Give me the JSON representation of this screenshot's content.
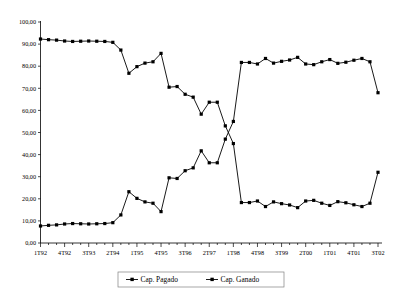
{
  "chart_data": {
    "type": "line",
    "title": "",
    "subtitle": "",
    "xlabel": "",
    "ylabel": "",
    "ylim": [
      0,
      100
    ],
    "ytick_labels": [
      "0,00",
      "10,00",
      "20,00",
      "30,00",
      "40,00",
      "50,00",
      "60,00",
      "70,00",
      "80,00",
      "90,00",
      "100,00"
    ],
    "ytick_values": [
      0,
      10,
      20,
      30,
      40,
      50,
      60,
      70,
      80,
      90,
      100
    ],
    "grid": false,
    "legend_position": "bottom",
    "categories": [
      "1T92",
      "2T92",
      "3T92",
      "4T92",
      "1T93",
      "2T93",
      "3T93",
      "4T93",
      "1T94",
      "2T94",
      "3T94",
      "4T94",
      "1T95",
      "2T95",
      "3T95",
      "4T95",
      "1T96",
      "2T96",
      "3T96",
      "4T96",
      "1T97",
      "2T97",
      "3T97",
      "4T97",
      "1T98",
      "2T98",
      "3T98",
      "4T98",
      "1T99",
      "2T99",
      "3T99",
      "4T99",
      "1T00",
      "2T00",
      "3T00",
      "4T00",
      "1T01",
      "2T01",
      "3T01",
      "4T01",
      "1T02",
      "2T02",
      "3T02"
    ],
    "xtick_labels": [
      "1T92",
      "4T92",
      "3T93",
      "2T94",
      "1T95",
      "4T95",
      "3T96",
      "2T97",
      "1T98",
      "4T98",
      "3T99",
      "2T00",
      "1T01",
      "4T01",
      "3T02"
    ],
    "xtick_indices": [
      0,
      3,
      6,
      9,
      12,
      15,
      18,
      21,
      24,
      27,
      30,
      33,
      36,
      39,
      42
    ],
    "series": [
      {
        "name": "Cap. Pagado",
        "marker": "square",
        "color": "#000000",
        "values": [
          92.3,
          92.0,
          91.8,
          91.4,
          91.2,
          91.3,
          91.4,
          91.3,
          91.2,
          90.8,
          87.3,
          76.8,
          79.8,
          81.4,
          82.0,
          85.8,
          70.5,
          70.8,
          67.3,
          66.0,
          58.3,
          63.7,
          63.7,
          53.0,
          45.0,
          18.3,
          18.3,
          19.0,
          16.5,
          18.6,
          17.8,
          17.2,
          16.0,
          19.0,
          19.3,
          18.0,
          17.0,
          18.7,
          18.2,
          17.3,
          16.5,
          18.0,
          32.0
        ]
      },
      {
        "name": "Cap. Ganado",
        "marker": "square",
        "color": "#000000",
        "values": [
          7.7,
          8.0,
          8.2,
          8.6,
          8.8,
          8.7,
          8.6,
          8.7,
          8.8,
          9.2,
          12.7,
          23.2,
          20.2,
          18.6,
          18.0,
          14.2,
          29.5,
          29.2,
          32.7,
          34.0,
          41.7,
          36.3,
          36.3,
          47.0,
          55.0,
          81.7,
          81.7,
          81.0,
          83.5,
          81.4,
          82.2,
          82.8,
          84.0,
          81.0,
          80.7,
          82.0,
          83.0,
          81.3,
          81.8,
          82.7,
          83.5,
          82.0,
          68.0
        ]
      }
    ]
  },
  "legend": {
    "items": [
      {
        "label": "Cap. Pagado"
      },
      {
        "label": "Cap. Ganado"
      }
    ]
  }
}
